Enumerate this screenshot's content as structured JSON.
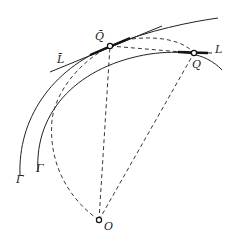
{
  "diagram": {
    "type": "geometric-construction",
    "labels": {
      "Q_bar": "Q̄",
      "Q": "Q",
      "L": "L",
      "L_bar": "L̄",
      "Gamma": "Γ",
      "Gamma_bar": "Γ̄",
      "O": "O"
    },
    "points": [
      {
        "name": "Q̄",
        "x": 110,
        "y": 46
      },
      {
        "name": "Q",
        "x": 194,
        "y": 53
      },
      {
        "name": "O",
        "x": 99,
        "y": 220
      }
    ],
    "curves": [
      {
        "name": "Γ̄",
        "style": "solid",
        "description": "outer curve"
      },
      {
        "name": "Γ",
        "style": "solid",
        "description": "inner curve"
      },
      {
        "name": "L̄",
        "style": "solid",
        "description": "tangent line at Q̄"
      },
      {
        "name": "L",
        "style": "solid",
        "description": "tangent line at Q"
      },
      {
        "name": "arc-O",
        "style": "dashed",
        "description": "circular arc through O"
      },
      {
        "name": "segments",
        "style": "dashed",
        "description": "O–Q̄, O–Q, Q̄–Q, Q̄–Q arc"
      }
    ]
  }
}
